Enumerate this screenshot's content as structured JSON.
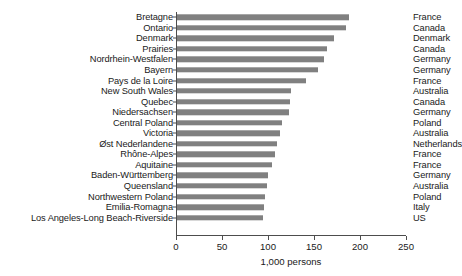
{
  "chart_data": {
    "type": "bar",
    "orientation": "horizontal",
    "title": "",
    "xlabel": "1,000 persons",
    "ylabel": "",
    "xlim": [
      0,
      250
    ],
    "xticks": [
      0,
      50,
      100,
      150,
      200,
      250
    ],
    "grid": false,
    "legend": false,
    "bar_color": "#808080",
    "axis_color": "#4d4d4d",
    "categories": [
      "Bretagne",
      "Ontario",
      "Denmark",
      "Prairies",
      "Nordrhein-Westfalen",
      "Bayern",
      "Pays de la Loire",
      "New South Wales",
      "Quebec",
      "Niedersachsen",
      "Central Poland",
      "Victoria",
      "Øst Nederlandene",
      "Rhône-Alpes",
      "Aquitaine",
      "Baden-Württemberg",
      "Queensland",
      "Northwestern Poland",
      "Emilia-Romagna",
      "Los Angeles-Long Beach-Riverside"
    ],
    "values": [
      188,
      185,
      172,
      164,
      161,
      154,
      141,
      125,
      124,
      123,
      115,
      113,
      110,
      108,
      104,
      100,
      99,
      97,
      96,
      95
    ],
    "secondary_labels": [
      "France",
      "Canada",
      "Denmark",
      "Canada",
      "Germany",
      "Germany",
      "France",
      "Australia",
      "Canada",
      "Germany",
      "Poland",
      "Australia",
      "Netherlands",
      "France",
      "France",
      "Germany",
      "Australia",
      "Poland",
      "Italy",
      "US"
    ]
  }
}
